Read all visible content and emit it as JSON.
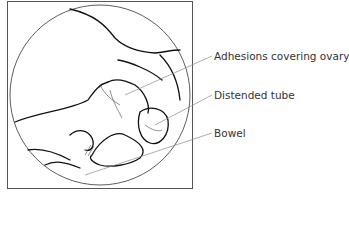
{
  "figure": {
    "labels": [
      {
        "text": "Adhesions covering ovary"
      },
      {
        "text": "Distended tube"
      },
      {
        "text": "Bowel"
      }
    ]
  }
}
